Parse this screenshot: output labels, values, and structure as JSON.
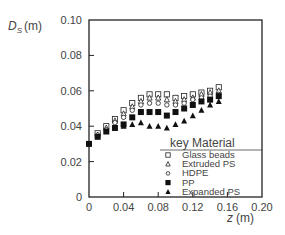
{
  "chart_data": {
    "type": "scatter",
    "title": "",
    "xlabel": "z (m)",
    "ylabel": "D_S (m)",
    "ylabel_main": "D",
    "ylabel_sub": "S",
    "ylabel_unit": "(m)",
    "xlabel_var": "z",
    "xlabel_unit": "(m)",
    "xlim": [
      0,
      0.2
    ],
    "ylim": [
      0,
      0.1
    ],
    "xticks": [
      "0",
      "0.04",
      "0.08",
      "0.12",
      "0.16",
      "0.20"
    ],
    "yticks": [
      "0",
      "0.02",
      "0.04",
      "0.06",
      "0.08",
      "0.10"
    ],
    "grid": false,
    "legend_position": "lower right inside",
    "legend_title": "key Material",
    "series": [
      {
        "name": "Glass beads",
        "marker": "open-square",
        "x": [
          0.01,
          0.02,
          0.03,
          0.04,
          0.05,
          0.06,
          0.07,
          0.08,
          0.09,
          0.1,
          0.11,
          0.12,
          0.13,
          0.14,
          0.15
        ],
        "y": [
          0.036,
          0.04,
          0.044,
          0.049,
          0.053,
          0.056,
          0.058,
          0.058,
          0.058,
          0.056,
          0.057,
          0.058,
          0.059,
          0.06,
          0.062
        ]
      },
      {
        "name": "Extruded PS",
        "marker": "open-triangle",
        "x": [
          0.01,
          0.02,
          0.03,
          0.04,
          0.05,
          0.06,
          0.07,
          0.08,
          0.09,
          0.1,
          0.11,
          0.12,
          0.13,
          0.14,
          0.15
        ],
        "y": [
          0.035,
          0.039,
          0.043,
          0.047,
          0.051,
          0.054,
          0.056,
          0.056,
          0.055,
          0.054,
          0.055,
          0.056,
          0.058,
          0.059,
          0.06
        ]
      },
      {
        "name": "HDPE",
        "marker": "open-circle",
        "x": [
          0.01,
          0.02,
          0.03,
          0.04,
          0.05,
          0.06,
          0.07,
          0.08,
          0.09,
          0.1,
          0.11,
          0.12,
          0.13,
          0.14,
          0.15
        ],
        "y": [
          0.035,
          0.038,
          0.042,
          0.045,
          0.049,
          0.052,
          0.053,
          0.053,
          0.052,
          0.052,
          0.053,
          0.055,
          0.056,
          0.057,
          0.058
        ]
      },
      {
        "name": "PP",
        "marker": "filled-square",
        "x": [
          0.0,
          0.01,
          0.02,
          0.03,
          0.04,
          0.05,
          0.06,
          0.07,
          0.08,
          0.09,
          0.1,
          0.11,
          0.12,
          0.13,
          0.14,
          0.15
        ],
        "y": [
          0.03,
          0.034,
          0.037,
          0.039,
          0.041,
          0.045,
          0.048,
          0.048,
          0.048,
          0.046,
          0.048,
          0.05,
          0.052,
          0.054,
          0.055,
          0.057
        ]
      },
      {
        "name": "Expanded PS",
        "marker": "filled-triangle",
        "x": [
          0.04,
          0.05,
          0.06,
          0.07,
          0.08,
          0.09,
          0.1,
          0.11,
          0.12,
          0.13,
          0.14,
          0.15
        ],
        "y": [
          0.04,
          0.041,
          0.042,
          0.04,
          0.04,
          0.039,
          0.041,
          0.043,
          0.046,
          0.049,
          0.052,
          0.054
        ]
      }
    ]
  }
}
